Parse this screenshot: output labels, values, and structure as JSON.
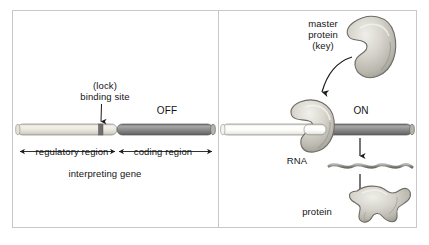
{
  "figure": {
    "background": "#ffffff",
    "border_color": "#c8c8c8"
  },
  "colors": {
    "regulatory_region_light": "#e9e7e0",
    "regulatory_region_white": "#fdfdfb",
    "coding_region_dark": "#8a8a8a",
    "binding_site": "#6b6b6b",
    "protein_fill": "#cfcdc6",
    "protein_outline": "#6e6c66",
    "rna_color": "#9a9892",
    "arrow_color": "#1a1a1a",
    "text_color": "#141414"
  },
  "panels": [
    {
      "id": "off",
      "state_label": "OFF",
      "labels": {
        "lock": "(lock)",
        "binding_site": "binding site",
        "regulatory_region": "regulatory region",
        "coding_region": "coding region",
        "gene_caption": "interpreting gene"
      },
      "gene": {
        "regulatory_region": {
          "x": 17,
          "width": 100,
          "shade": "light"
        },
        "binding_site": {
          "x": 99,
          "width": 5
        },
        "coding_region": {
          "x": 117,
          "width": 96,
          "shade": "dark"
        },
        "y": 124,
        "height": 11
      },
      "arrows": [
        {
          "name": "binding-site-pointer",
          "type": "down"
        },
        {
          "name": "regulatory-region-span",
          "type": "double-headed"
        },
        {
          "name": "coding-region-span",
          "type": "double-headed"
        }
      ]
    },
    {
      "id": "on",
      "state_label": "ON",
      "labels": {
        "master_protein_line1": "master",
        "master_protein_line2": "protein",
        "master_protein_line3": "(key)",
        "rna": "RNA",
        "protein": "protein"
      },
      "gene": {
        "regulatory_region": {
          "x": 222,
          "width": 100,
          "shade": "white"
        },
        "coding_region": {
          "x": 322,
          "width": 90,
          "shade": "dark"
        },
        "y": 124,
        "height": 11
      },
      "shapes": [
        {
          "name": "master-protein-key",
          "description": "kidney-shaped protein with notch"
        },
        {
          "name": "bound-master-protein",
          "description": "protein docked at binding site"
        },
        {
          "name": "rna-strand",
          "description": "wavy transcript line"
        },
        {
          "name": "protein-product",
          "description": "irregular folded protein blob"
        }
      ],
      "arrows": [
        {
          "name": "binding-curved-arrow",
          "type": "curved"
        },
        {
          "name": "transcription-arrow",
          "type": "down"
        },
        {
          "name": "translation-arrow",
          "type": "down"
        }
      ]
    }
  ]
}
